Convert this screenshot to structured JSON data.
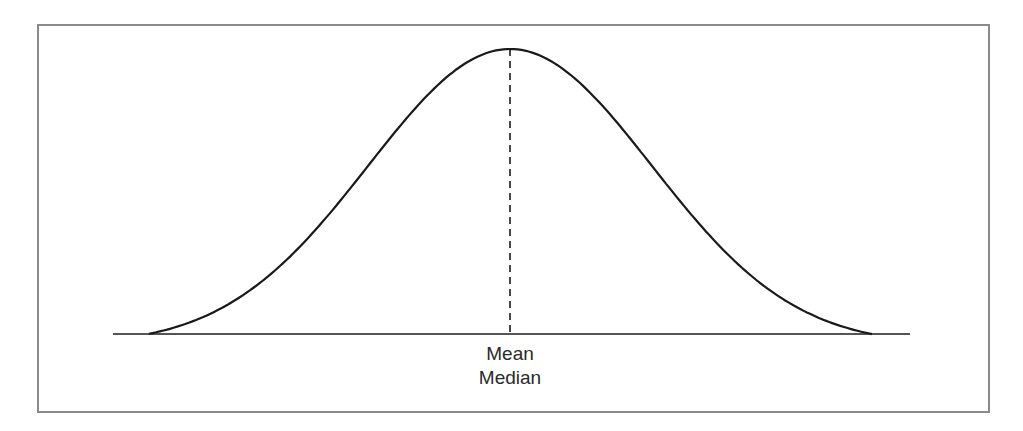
{
  "chart_data": {
    "type": "line",
    "title": "",
    "curve": "normal",
    "x_range": [
      149,
      872
    ],
    "peak_x": 510,
    "annotations": [
      {
        "type": "dashed-vertical-line",
        "position": "center",
        "label": "Mean"
      },
      {
        "type": "label",
        "position": "center",
        "label": "Median"
      }
    ],
    "xlabel": "",
    "ylabel": "",
    "grid": false,
    "legend": null
  },
  "labels": {
    "mean": "Mean",
    "median": "Median"
  },
  "colors": {
    "curve": "#1a1a1a",
    "baseline": "#555555",
    "frame": "#8a8a8a",
    "text": "#2a2a2a"
  }
}
